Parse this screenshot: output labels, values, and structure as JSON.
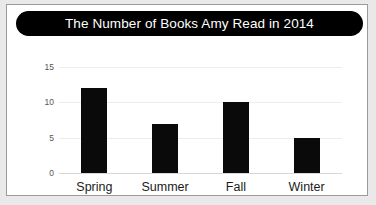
{
  "card": {
    "background": "#ffffff",
    "border_color": "#9a9a9a",
    "page_background": "#e9e9e9"
  },
  "title": {
    "text": "The Number of Books Amy Read in 2014",
    "background": "#000000",
    "color": "#ffffff"
  },
  "axis": {
    "y_ticks": [
      "0",
      "5",
      "10",
      "15"
    ],
    "x_labels": [
      "Spring",
      "Summer",
      "Fall",
      "Winter"
    ]
  },
  "chart_data": {
    "type": "bar",
    "title": "The Number of Books Amy Read in 2014",
    "categories": [
      "Spring",
      "Summer",
      "Fall",
      "Winter"
    ],
    "values": [
      12,
      7,
      10,
      5
    ],
    "xlabel": "",
    "ylabel": "",
    "ylim": [
      0,
      15
    ],
    "yticks": [
      0,
      5,
      10,
      15
    ],
    "grid": true,
    "legend": false,
    "bar_color": "#0a0a0a",
    "gridline_color": "#ededed"
  }
}
